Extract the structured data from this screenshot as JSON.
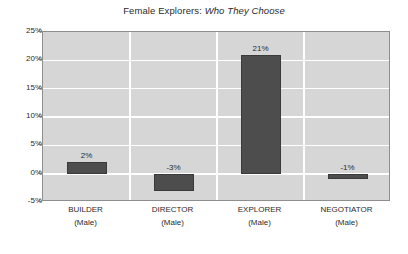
{
  "chart_data": {
    "type": "bar",
    "title_parts": {
      "regular": "Female Explorers:",
      "italic": "Who They Choose"
    },
    "categories": [
      "BUILDER",
      "DIRECTOR",
      "EXPLORER",
      "NEGOTIATOR"
    ],
    "category_sublabels": [
      "(Male)",
      "(Male)",
      "(Male)",
      "(Male)"
    ],
    "values": [
      2,
      -3,
      21,
      -1
    ],
    "data_labels": [
      "2%",
      "-3%",
      "21%",
      "-1%"
    ],
    "xlabel": "",
    "ylabel": "",
    "ylim": [
      -5,
      25
    ],
    "ytick_values": [
      25,
      20,
      15,
      10,
      5,
      0,
      -5
    ],
    "ytick_labels": [
      "25%",
      "20%",
      "15%",
      "10%",
      "5%",
      "0%",
      "-5%"
    ],
    "grid": true,
    "legend": false,
    "colors": {
      "bar": "#4d4d4d",
      "bar_border": "#3a3a3a",
      "plot_background": "#d6d6d6",
      "plot_border": "#8e8e8e",
      "gridline": "#ffffff",
      "text": "#2b2b2b",
      "page_background": "#ffffff"
    }
  }
}
